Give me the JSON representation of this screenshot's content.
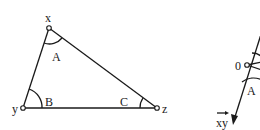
{
  "figure_left": {
    "type": "triangle",
    "vertices": {
      "x": {
        "label": "x",
        "angle_label": "A"
      },
      "y": {
        "label": "y",
        "angle_label": "B"
      },
      "z": {
        "label": "z",
        "angle_label": "C"
      }
    }
  },
  "figure_right": {
    "point_label": "0",
    "angle_label": "A",
    "vector_label": "xy"
  },
  "colors": {
    "ink": "#1a1a1a",
    "background": "#ffffff"
  }
}
